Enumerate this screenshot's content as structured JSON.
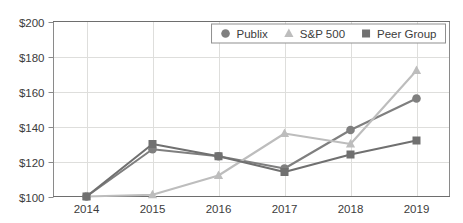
{
  "chart_data": {
    "type": "line",
    "title": "",
    "subtitle": "",
    "xlabel": "",
    "ylabel": "",
    "categories": [
      "2014",
      "2015",
      "2016",
      "2017",
      "2018",
      "2019"
    ],
    "x_tick_labels": [
      "2014",
      "2015",
      "2016",
      "2017",
      "2018",
      "2019"
    ],
    "y_tick_labels": [
      "$100",
      "$120",
      "$140",
      "$160",
      "$180",
      "$200"
    ],
    "y_tick_values": [
      100,
      120,
      140,
      160,
      180,
      200
    ],
    "ylim": [
      100,
      200
    ],
    "grid": true,
    "legend_position": "top-right",
    "series": [
      {
        "name": "Publix",
        "marker": "circle",
        "color": "#7f7f7f",
        "values": [
          100,
          127,
          123,
          116,
          138,
          156
        ]
      },
      {
        "name": "S&P 500",
        "marker": "triangle",
        "color": "#bdbdbd",
        "values": [
          100,
          101,
          112,
          136,
          130,
          172
        ]
      },
      {
        "name": "Peer Group",
        "marker": "square",
        "color": "#707070",
        "values": [
          100,
          130,
          123,
          114,
          124,
          132
        ]
      }
    ],
    "legend": [
      {
        "label": "Publix",
        "marker": "circle",
        "color": "#7f7f7f"
      },
      {
        "label": "S&P 500",
        "marker": "triangle",
        "color": "#bdbdbd"
      },
      {
        "label": "Peer Group",
        "marker": "square",
        "color": "#707070"
      }
    ],
    "colors": {
      "grid": "#dededc",
      "frame": "#6e6e6e",
      "text": "#3c3c3c",
      "background": "#ffffff"
    }
  }
}
